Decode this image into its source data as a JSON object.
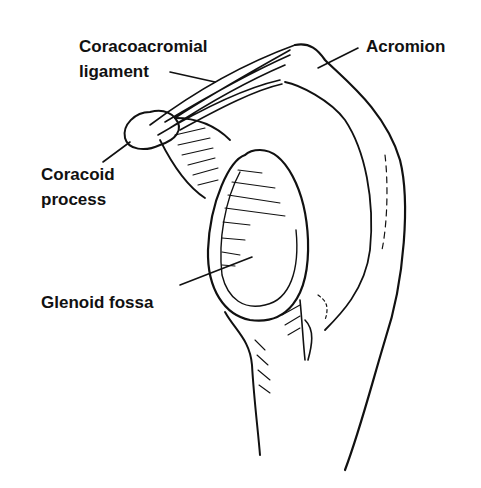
{
  "diagram": {
    "labels": {
      "coracoacromial_line1": "Coracoacromial",
      "coracoacromial_line2": "ligament",
      "acromion": "Acromion",
      "coracoid_line1": "Coracoid",
      "coracoid_line2": "process",
      "glenoid": "Glenoid fossa"
    },
    "colors": {
      "ink": "#111111",
      "background": "#ffffff"
    }
  }
}
